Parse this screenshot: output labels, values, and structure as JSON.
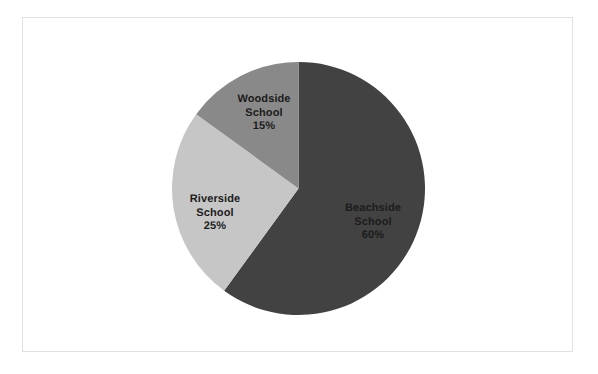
{
  "chart_data": {
    "type": "pie",
    "title": "",
    "subtitle": "",
    "xlabel": "",
    "ylabel": "",
    "legend": "none",
    "grid": false,
    "start_angle_deg": 0,
    "direction": "clockwise",
    "categories": [
      "Beachside School",
      "Riverside School",
      "Woodside School"
    ],
    "values": [
      60,
      25,
      15
    ],
    "value_unit": "%",
    "labels_inside": true,
    "slices": [
      {
        "name": "Beachside School",
        "name_line1": "Beachside",
        "name_line2": "School",
        "value": 60,
        "value_label": "60%",
        "color": "#424242",
        "start_deg": 0,
        "end_deg": 216
      },
      {
        "name": "Riverside School",
        "name_line1": "Riverside",
        "name_line2": "School",
        "value": 25,
        "value_label": "25%",
        "color": "#c6c6c6",
        "start_deg": 216,
        "end_deg": 306
      },
      {
        "name": "Woodside School",
        "name_line1": "Woodside",
        "name_line2": "School",
        "value": 15,
        "value_label": "15%",
        "color": "#898989",
        "start_deg": 306,
        "end_deg": 360
      }
    ]
  },
  "frame": {
    "border_color": "#e2e2e2",
    "background_color": "#ffffff"
  }
}
